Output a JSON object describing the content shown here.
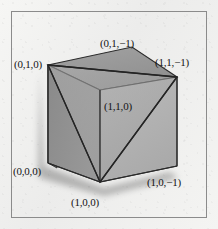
{
  "figure": {
    "background_color": "#f2f2f0",
    "frame_color": "#8b8b8b"
  },
  "geometry": {
    "shape": "cube",
    "projection": "oblique-perspective",
    "cross_section": "triangle through (0,1,0), (1,1,-1) and (1,0,0)",
    "faces": [
      {
        "name": "top-face",
        "fill": "#9a9a9a"
      },
      {
        "name": "left-face",
        "fill": "#9f9f9f"
      },
      {
        "name": "front-left-face",
        "fill": "#8e8e8e"
      },
      {
        "name": "front-right-face",
        "fill": "#b4b4b4"
      },
      {
        "name": "cut-plane",
        "fill": "#a6a6a6"
      }
    ],
    "edge_color": "#2a2a2a",
    "shadow_color": "rgba(90,90,90,0.45)"
  },
  "labels": {
    "top_back_left": "(0,1,0)",
    "top_back_right": "(0,1,−1)",
    "top_front_right": "(1,1,−1)",
    "mid_front": "(1,1,0)",
    "bottom_left": "(0,0,0)",
    "bottom_front": "(1,0,0)",
    "bottom_right": "(1,0,−1)"
  },
  "vertices": {
    "top_back_left": {
      "x": 48,
      "y": 65
    },
    "top_back_right": {
      "x": 132,
      "y": 47
    },
    "top_front_right": {
      "x": 177,
      "y": 77
    },
    "mid_front": {
      "x": 100,
      "y": 90
    },
    "bottom_left": {
      "x": 48,
      "y": 163
    },
    "bottom_front": {
      "x": 100,
      "y": 182
    },
    "bottom_right": {
      "x": 177,
      "y": 166
    }
  }
}
